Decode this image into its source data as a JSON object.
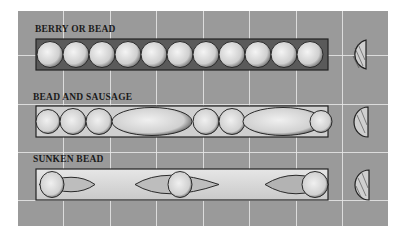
{
  "colors": {
    "background": "#9a9a9a",
    "grid": "#e8e8e8",
    "ink": "#1a1a1a",
    "bead_fill": "#d9d9d9",
    "strip_fill": "#cfcfcf"
  },
  "rows": [
    {
      "label": "BERRY OR BEAD",
      "pattern": "berry-or-bead"
    },
    {
      "label": "BEAD AND SAUSAGE",
      "pattern": "bead-and-sausage"
    },
    {
      "label": "SUNKEN BEAD",
      "pattern": "sunken-bead"
    }
  ]
}
